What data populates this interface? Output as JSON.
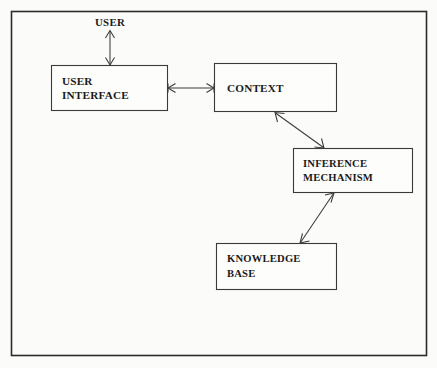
{
  "diagram": {
    "background_color": "#fbfbfa",
    "stroke_color": "#3a3a3a",
    "frame_color": "#2b2b2b",
    "text_color": "#1a1a1a",
    "frame": {
      "x": 11,
      "y": 11,
      "width": 416,
      "height": 345
    },
    "external_actors": [
      {
        "id": "user",
        "label": "USER",
        "x": 110,
        "y": 26
      }
    ],
    "nodes": [
      {
        "id": "user-interface",
        "label_line1": "USER",
        "label_line2": "INTERFACE",
        "x": 51,
        "y": 65,
        "width": 117,
        "height": 46
      },
      {
        "id": "context",
        "label_line1": "CONTEXT",
        "label_line2": "",
        "x": 214,
        "y": 63,
        "width": 123,
        "height": 49
      },
      {
        "id": "inference-mechanism",
        "label_line1": "INFERENCE",
        "label_line2": "MECHANISM",
        "x": 293,
        "y": 148,
        "width": 120,
        "height": 45
      },
      {
        "id": "knowledge-base",
        "label_line1": "KNOWLEDGE",
        "label_line2": "BASE",
        "x": 216,
        "y": 243,
        "width": 121,
        "height": 47
      }
    ],
    "connectors": [
      {
        "id": "user-to-user-interface",
        "from": "user",
        "to": "user-interface",
        "style": "double-headed",
        "orientation": "vertical",
        "x1": 110,
        "y1": 31,
        "x2": 110,
        "y2": 65
      },
      {
        "id": "user-interface-to-context",
        "from": "user-interface",
        "to": "context",
        "style": "double-headed",
        "orientation": "horizontal",
        "x1": 168,
        "y1": 88,
        "x2": 214,
        "y2": 88
      },
      {
        "id": "context-to-inference-mechanism",
        "from": "context",
        "to": "inference-mechanism",
        "style": "double-headed",
        "orientation": "diagonal",
        "x1": 275,
        "y1": 112,
        "x2": 324,
        "y2": 148
      },
      {
        "id": "knowledge-base-to-inference-mechanism",
        "from": "knowledge-base",
        "to": "inference-mechanism",
        "style": "double-headed",
        "orientation": "diagonal",
        "x1": 300,
        "y1": 243,
        "x2": 334,
        "y2": 193
      }
    ]
  }
}
